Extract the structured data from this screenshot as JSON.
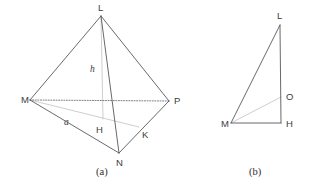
{
  "figure": {
    "background_color": "#ffffff",
    "edge_color": "#58585c",
    "hidden_edge_color": "#6a6a70",
    "light_edge_color": "#c8c8cc",
    "label_color": "#3b3b40",
    "panels": [
      {
        "caption": "(a)",
        "caption_pos": {
          "x": 96,
          "y": 175
        },
        "shape": "tetrahedron",
        "vertices": [
          {
            "name": "L",
            "x": 101,
            "y": 16,
            "label_x": 98,
            "label_y": 11
          },
          {
            "name": "M",
            "x": 30,
            "y": 100,
            "label_x": 21,
            "label_y": 103
          },
          {
            "name": "P",
            "x": 169,
            "y": 101,
            "label_x": 174,
            "label_y": 104
          },
          {
            "name": "N",
            "x": 119,
            "y": 153,
            "label_x": 116,
            "label_y": 166
          },
          {
            "name": "H",
            "x": 103,
            "y": 119,
            "label_x": 96,
            "label_y": 133
          },
          {
            "name": "K",
            "x": 139,
            "y": 127,
            "label_x": 142,
            "label_y": 138
          }
        ],
        "edges_solid": [
          {
            "from": "L",
            "to": "M"
          },
          {
            "from": "L",
            "to": "P"
          },
          {
            "from": "L",
            "to": "N"
          },
          {
            "from": "M",
            "to": "N"
          },
          {
            "from": "N",
            "to": "P"
          }
        ],
        "edges_hidden": [
          {
            "from": "M",
            "to": "P"
          }
        ],
        "edges_light": [
          {
            "from": "L",
            "to": "H"
          },
          {
            "from": "M",
            "to": "K"
          }
        ],
        "measures": [
          {
            "name": "h",
            "x": 90,
            "y": 72
          },
          {
            "name": "a",
            "x": 64,
            "y": 125
          }
        ]
      },
      {
        "caption": "(b)",
        "caption_pos": {
          "x": 249,
          "y": 175
        },
        "shape": "right-triangle",
        "vertices": [
          {
            "name": "L",
            "x": 280,
            "y": 25,
            "label_x": 277,
            "label_y": 19
          },
          {
            "name": "M",
            "x": 231,
            "y": 123,
            "label_x": 221,
            "label_y": 127
          },
          {
            "name": "H",
            "x": 281,
            "y": 123,
            "label_x": 286,
            "label_y": 127
          },
          {
            "name": "O",
            "x": 281,
            "y": 97,
            "label_x": 286,
            "label_y": 100
          }
        ],
        "edges_solid": [
          {
            "from": "M",
            "to": "L"
          },
          {
            "from": "L",
            "to": "H"
          },
          {
            "from": "M",
            "to": "H"
          }
        ],
        "edges_hidden": [],
        "edges_light": [
          {
            "from": "M",
            "to": "O"
          }
        ],
        "measures": []
      }
    ]
  }
}
